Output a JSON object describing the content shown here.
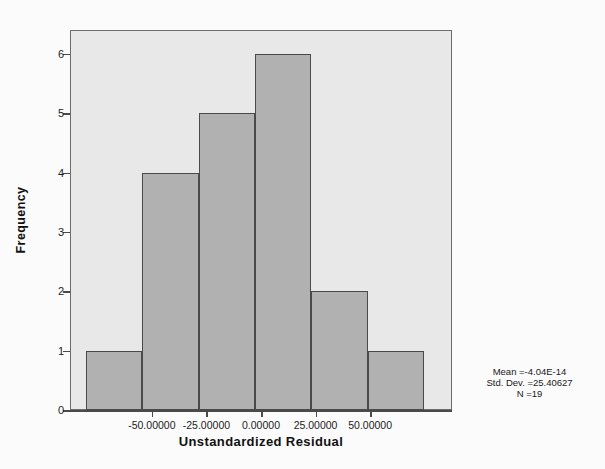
{
  "chart_data": {
    "type": "bar",
    "title": "",
    "subtitle": "",
    "xlabel": "Unstandardized Residual",
    "ylabel": "Frequency",
    "categories": [
      "-62.5",
      "-37.5",
      "-12.5",
      "12.5",
      "37.5",
      "62.5"
    ],
    "bin_centers": [
      -62.5,
      -37.5,
      -12.5,
      12.5,
      37.5,
      62.5
    ],
    "bin_edges": [
      -75,
      -50,
      -25,
      0,
      25,
      50,
      75
    ],
    "bin_width": 25,
    "values": [
      1,
      4,
      5,
      6,
      2,
      1
    ],
    "xlim": [
      -87.5,
      87.5
    ],
    "ylim": [
      0,
      6.4
    ],
    "x_ticks": [
      -50,
      -25,
      0,
      25,
      50
    ],
    "x_tick_labels": [
      "-50.00000",
      "-25.00000",
      "0.00000",
      "25.00000",
      "50.00000"
    ],
    "y_ticks": [
      0,
      1,
      2,
      3,
      4,
      5,
      6
    ],
    "y_tick_labels": [
      "0",
      "1",
      "2",
      "3",
      "4",
      "5",
      "6"
    ],
    "grid": false,
    "legend": false,
    "bar_fill_color": "#b2b2b2",
    "bar_border_color": "#4a4a4a",
    "plot_background_color": "#e9e9e9",
    "axis_color": "#4a4a4a"
  },
  "annotation": {
    "mean_line": "Mean =-4.04E-14",
    "std_dev_line": "Std. Dev. =25.40627",
    "n_line": "N =19"
  }
}
